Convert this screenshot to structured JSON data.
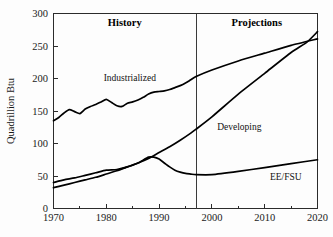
{
  "chart_data": {
    "type": "line",
    "title": "",
    "xlabel": "",
    "ylabel": "Quadrillion Btu",
    "xlim": [
      1970,
      2020
    ],
    "ylim": [
      0,
      300
    ],
    "grid": false,
    "legend_position": "inline-annotations",
    "x_ticks": [
      "1970",
      "1980",
      "1990",
      "2000",
      "2010",
      "2020"
    ],
    "x_tick_values": [
      1970,
      1980,
      1990,
      2000,
      2010,
      2020
    ],
    "x_minor_tick_values": [
      1975,
      1985,
      1995,
      2005,
      2015
    ],
    "y_ticks": [
      "0",
      "50",
      "100",
      "150",
      "200",
      "250",
      "300"
    ],
    "y_tick_values": [
      0,
      50,
      100,
      150,
      200,
      250,
      300
    ],
    "divider_x": 1997,
    "region_labels": [
      {
        "text": "History",
        "x": 1983.5
      },
      {
        "text": "Projections",
        "x": 2008.5
      }
    ],
    "series": [
      {
        "name": "Industrialized",
        "label": "Industrialized",
        "label_x": 1979.5,
        "label_y": 196,
        "x": [
          1970,
          1971,
          1972,
          1973,
          1974,
          1975,
          1976,
          1977,
          1978,
          1979,
          1980,
          1981,
          1982,
          1983,
          1984,
          1985,
          1986,
          1987,
          1988,
          1989,
          1990,
          1991,
          1992,
          1993,
          1994,
          1995,
          1996,
          1997,
          2000,
          2005,
          2010,
          2015,
          2020
        ],
        "values": [
          135,
          140,
          147,
          152,
          149,
          146,
          153,
          157,
          160,
          164,
          168,
          163,
          158,
          157,
          162,
          164,
          167,
          171,
          176,
          179,
          180,
          181,
          183,
          186,
          189,
          193,
          198,
          203,
          213,
          227,
          239,
          251,
          261
        ]
      },
      {
        "name": "Developing",
        "label": "Developing",
        "label_x": 2001,
        "label_y": 121,
        "x": [
          1970,
          1972,
          1974,
          1976,
          1978,
          1980,
          1982,
          1984,
          1986,
          1988,
          1990,
          1992,
          1994,
          1996,
          1997,
          2000,
          2005,
          2010,
          2015,
          2018,
          2020
        ],
        "values": [
          32,
          36,
          40,
          44,
          48,
          53,
          58,
          64,
          70,
          77,
          86,
          95,
          105,
          116,
          122,
          141,
          176,
          208,
          240,
          256,
          272
        ]
      },
      {
        "name": "EE/FSU",
        "label": "EE/FSU",
        "label_x": 2017,
        "label_y": 44,
        "x": [
          1970,
          1972,
          1974,
          1976,
          1978,
          1980,
          1982,
          1984,
          1986,
          1988,
          1989,
          1990,
          1991,
          1992,
          1993,
          1994,
          1995,
          1996,
          1997,
          2000,
          2005,
          2010,
          2015,
          2020
        ],
        "values": [
          40,
          44,
          47,
          51,
          55,
          59,
          60,
          64,
          70,
          79,
          79,
          76,
          70,
          64,
          59,
          56,
          54,
          53,
          52,
          52,
          57,
          63,
          69,
          75
        ]
      }
    ]
  }
}
